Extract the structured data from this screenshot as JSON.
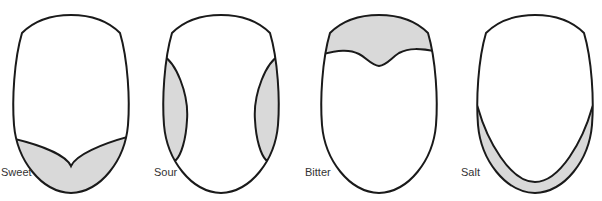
{
  "diagram": {
    "type": "tongue taste regions",
    "fill_color": "#d9d9d9",
    "outline_color": "#1a1a1a",
    "panels": [
      {
        "label": "Sweet",
        "region": "tip"
      },
      {
        "label": "Sour",
        "region": "sides"
      },
      {
        "label": "Bitter",
        "region": "back"
      },
      {
        "label": "Salt",
        "region": "tip edges"
      }
    ]
  }
}
